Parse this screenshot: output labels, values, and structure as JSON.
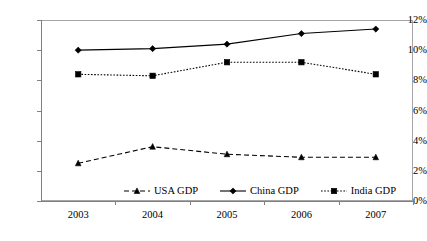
{
  "chart_data": {
    "type": "line",
    "title": "",
    "xlabel": "",
    "ylabel": "",
    "categories": [
      "2003",
      "2004",
      "2005",
      "2006",
      "2007"
    ],
    "ylim": [
      0,
      12
    ],
    "ytick_labels": [
      "0%",
      "2%",
      "4%",
      "6%",
      "8%",
      "10%",
      "12%"
    ],
    "ytick_values": [
      0,
      2,
      4,
      6,
      8,
      10,
      12
    ],
    "grid": false,
    "legend_position": "inside-bottom-center",
    "series": [
      {
        "name": "USA GDP",
        "marker": "triangle",
        "line_style": "dashed",
        "color": "#000000",
        "values": [
          2.5,
          3.6,
          3.1,
          2.9,
          2.9
        ]
      },
      {
        "name": "China GDP",
        "marker": "diamond",
        "line_style": "solid",
        "color": "#000000",
        "values": [
          10.0,
          10.1,
          10.4,
          11.1,
          11.4
        ]
      },
      {
        "name": "India GDP",
        "marker": "square",
        "line_style": "dotted",
        "color": "#000000",
        "values": [
          8.4,
          8.3,
          9.2,
          9.2,
          8.4
        ]
      }
    ]
  },
  "legend": {
    "items": [
      {
        "label": "USA GDP"
      },
      {
        "label": "China GDP"
      },
      {
        "label": "India GDP"
      }
    ]
  }
}
